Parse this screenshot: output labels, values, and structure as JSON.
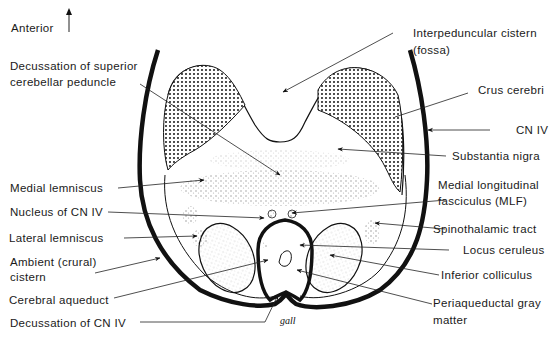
{
  "orientation": {
    "label": "Anterior",
    "icon": "arrow-up-icon"
  },
  "labels_left": {
    "decussation_scp_1": "Decussation of superior",
    "decussation_scp_2": "cerebellar peduncle",
    "medial_lemniscus": "Medial lemniscus",
    "nucleus_cn4": "Nucleus of CN IV",
    "lateral_lemniscus": "Lateral lemniscus",
    "ambient_1": "Ambient (crural)",
    "ambient_2": "cistern",
    "cerebral_aqueduct": "Cerebral aqueduct",
    "decussation_cn4": "Decussation of CN IV"
  },
  "labels_right": {
    "interpeduncular_1": "Interpeduncular cistern",
    "interpeduncular_2": "(fossa)",
    "crus_cerebri": "Crus cerebri",
    "cn4": "CN IV",
    "substantia_nigra": "Substantia nigra",
    "mlf_1": "Medial longitudinal",
    "mlf_2": "fasciculus (MLF)",
    "spinothalamic": "Spinothalamic tract",
    "locus_ceruleus": "Locus ceruleus",
    "inferior_colliculus": "Inferior colliculus",
    "pag_1": "Periaqueductal gray",
    "pag_2": "matter"
  },
  "signature": "gall",
  "colors": {
    "ink": "#1a1a1a",
    "stipple": "#9a9a9a",
    "background": "#ffffff"
  }
}
